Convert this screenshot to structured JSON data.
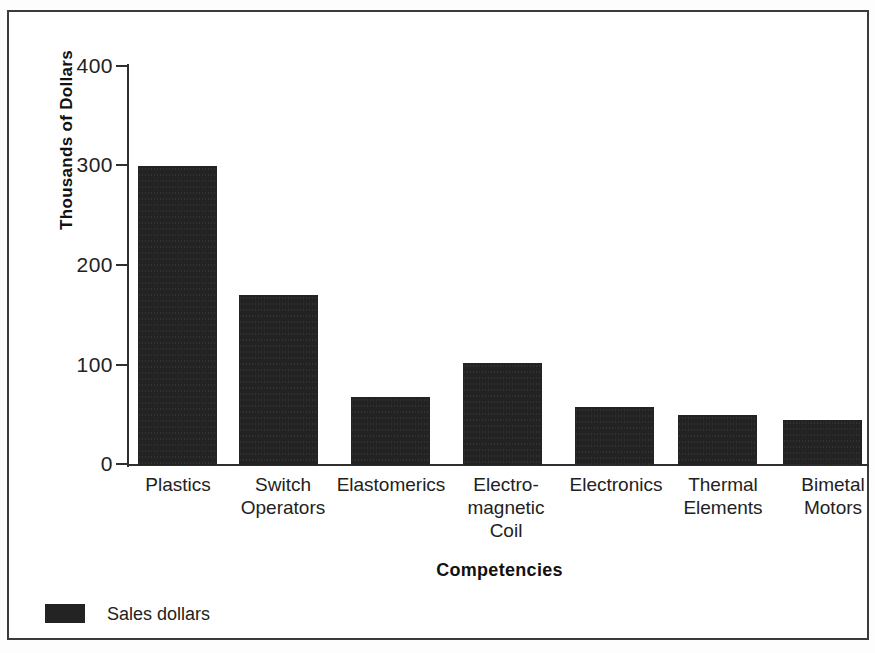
{
  "chart_data": {
    "type": "bar",
    "title": "",
    "xlabel": "Competencies",
    "ylabel": "Thousands of Dollars",
    "categories": [
      "Plastics",
      "Switch\nOperators",
      "Elastomerics",
      "Electro-\nmagnetic\nCoil",
      "Electronics",
      "Thermal\nElements",
      "Bimetal\nMotors"
    ],
    "values": [
      300,
      170,
      68,
      102,
      58,
      50,
      45
    ],
    "series": [
      {
        "name": "Sales dollars",
        "values": [
          300,
          170,
          68,
          102,
          58,
          50,
          45
        ]
      }
    ],
    "ylim": [
      0,
      400
    ],
    "yticks": [
      0,
      100,
      200,
      300,
      400
    ],
    "ytick_labels": [
      "0",
      "100",
      "200",
      "300",
      "400"
    ],
    "grid": false,
    "legend_position": "bottom-left",
    "bar_color": "#232323",
    "axis_color": "#2f2f2f",
    "background_color": "#ffffff"
  },
  "axes": {
    "y_title": "Thousands of Dollars",
    "x_title": "Competencies"
  },
  "legend": {
    "entries": [
      {
        "label": "Sales dollars",
        "color": "#232323"
      }
    ]
  }
}
